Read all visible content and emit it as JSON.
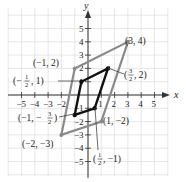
{
  "figure": {
    "x_axis_label": "x",
    "y_axis_label": "y",
    "x_ticks": [
      "-5",
      "-4",
      "-3",
      "-2",
      "1",
      "2",
      "3",
      "4",
      "5"
    ],
    "y_ticks": [
      "5",
      "4",
      "3",
      "2",
      "1",
      "-1",
      "-2",
      "-3",
      "-4",
      "-5"
    ],
    "colors": {
      "grid": "#dcdcdc",
      "axis": "#333333",
      "outer_shape": "#8a8a8a",
      "inner_shape": "#111111",
      "text": "#222222"
    },
    "outer_parallelogram": {
      "vertices": [
        {
          "x": -1,
          "y": 2,
          "label": "(−1, 2)"
        },
        {
          "x": 3,
          "y": 4,
          "label": "(3, 4)"
        },
        {
          "x": 1,
          "y": -2,
          "label": "(1, −2)"
        },
        {
          "x": -2,
          "y": -3,
          "label": "(−2, −3)"
        }
      ]
    },
    "inner_parallelogram": {
      "vertices": [
        {
          "x": -0.5,
          "y": 1,
          "label": "(−1/2, 1)"
        },
        {
          "x": 1.5,
          "y": 2,
          "label": "(3/2, 2)"
        },
        {
          "x": 0.5,
          "y": -1,
          "label": "(1/2, −1)"
        },
        {
          "x": -1,
          "y": -1.5,
          "label": "(−1, −3/2)"
        }
      ]
    }
  }
}
